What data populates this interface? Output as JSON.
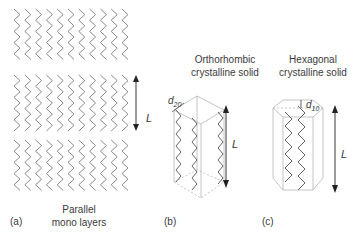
{
  "figure": {
    "panels": [
      {
        "id": "a",
        "tag": "(a)",
        "caption_line1": "Parallel",
        "caption_line2": "mono layers",
        "layer_count": 3,
        "chains_per_layer": 11,
        "dimension_label": "L"
      },
      {
        "id": "b",
        "tag": "(b)",
        "title_line1": "Orthorhombic",
        "title_line2": "crystalline solid",
        "spacing_label": "d",
        "spacing_sub": "20",
        "dimension_label": "L"
      },
      {
        "id": "c",
        "tag": "(c)",
        "title_line1": "Hexagonal",
        "title_line2": "crystalline solid",
        "spacing_label": "d",
        "spacing_sub": "10",
        "dimension_label": "L"
      }
    ],
    "colors": {
      "chain": "#8a8a8a",
      "box": "#b5b5b5",
      "arrow": "#222222",
      "text": "#3a3a3a"
    }
  }
}
